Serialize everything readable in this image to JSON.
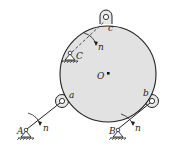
{
  "diagram": {
    "type": "mechanism",
    "labels": {
      "center": "O",
      "lug_top": "c",
      "lug_left": "a",
      "lug_right": "b",
      "support_A": "A",
      "support_B": "B",
      "support_C": "C",
      "normal_A": "n",
      "normal_B": "n",
      "normal_C": "n"
    },
    "colors": {
      "disk_fill": "#e2e2e2",
      "stroke": "#222222"
    }
  }
}
